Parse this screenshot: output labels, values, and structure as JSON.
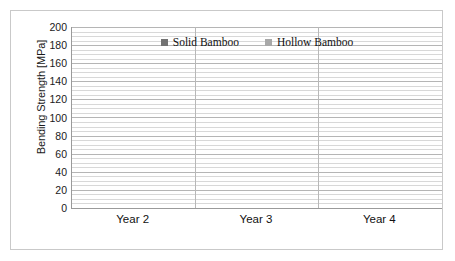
{
  "chart_data": {
    "type": "bar",
    "title": "",
    "xlabel": "",
    "ylabel": "Bending Strength [MPa]",
    "categories": [
      "Year 2",
      "Year 3",
      "Year 4"
    ],
    "ylim": [
      0,
      200
    ],
    "ytick_step": 20,
    "yticks": [
      200,
      180,
      160,
      140,
      120,
      100,
      80,
      60,
      40,
      20,
      0
    ],
    "grid": "horizontal-major-and-minor",
    "legend_position": "top-center",
    "series": [
      {
        "name": "Solid Bamboo",
        "color": "#727272",
        "values": [
          64.3,
          135.13,
          146.53
        ],
        "labels": [
          "64.3",
          "135.13",
          "146.53"
        ],
        "error_upper": [
          17.0,
          26.0,
          23.0
        ],
        "error_lower": [
          27.0,
          29.0,
          26.0
        ]
      },
      {
        "name": "Hollow Bamboo",
        "color": "#a8a8a8",
        "values": [
          39.1,
          46.04,
          73.3
        ],
        "labels": [
          "39.1",
          "46.04",
          "73.3"
        ],
        "error_upper": [
          13.0,
          11.0,
          13.0
        ],
        "error_lower": [
          12.0,
          11.0,
          13.0
        ]
      }
    ]
  },
  "legend": {
    "items": [
      {
        "label": "Solid Bamboo",
        "color": "#727272"
      },
      {
        "label": "Hollow Bamboo",
        "color": "#a8a8a8"
      }
    ]
  },
  "axis": {
    "y_title": "Bending Strength [MPa]"
  }
}
